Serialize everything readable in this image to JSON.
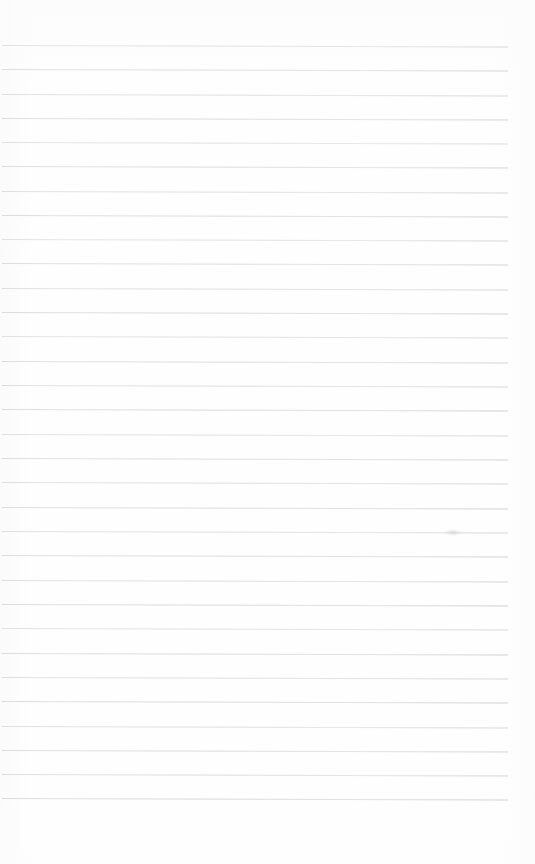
{
  "document": {
    "kind": "ruled-notebook-page",
    "title": "Blank Ruled Notebook Page",
    "page_width": 535,
    "page_height": 864,
    "background_color": "#fefefe",
    "content_text": "",
    "has_handwriting": false,
    "has_printed_text": false,
    "has_margin_rule": false
  },
  "ruling": {
    "line_color": "#dddee0",
    "line_thickness": 1,
    "line_count": 32,
    "first_line_y": 45,
    "last_line_y": 798,
    "line_spacing": 24.3,
    "line_start_x": 2,
    "line_end_x": 508,
    "skew_degrees": 0.18,
    "lines": [
      {
        "y": 45,
        "opacity": 0.72,
        "start_x": 2,
        "end_x": 508
      },
      {
        "y": 69,
        "opacity": 0.8,
        "start_x": 2,
        "end_x": 508
      },
      {
        "y": 94,
        "opacity": 0.76,
        "start_x": 2,
        "end_x": 508
      },
      {
        "y": 118,
        "opacity": 0.84,
        "start_x": 2,
        "end_x": 508
      },
      {
        "y": 142,
        "opacity": 0.7,
        "start_x": 2,
        "end_x": 508
      },
      {
        "y": 166,
        "opacity": 0.82,
        "start_x": 2,
        "end_x": 508
      },
      {
        "y": 191,
        "opacity": 0.78,
        "start_x": 2,
        "end_x": 508
      },
      {
        "y": 215,
        "opacity": 0.86,
        "start_x": 2,
        "end_x": 508
      },
      {
        "y": 239,
        "opacity": 0.74,
        "start_x": 2,
        "end_x": 508
      },
      {
        "y": 263,
        "opacity": 0.81,
        "start_x": 2,
        "end_x": 508
      },
      {
        "y": 288,
        "opacity": 0.77,
        "start_x": 2,
        "end_x": 508
      },
      {
        "y": 312,
        "opacity": 0.85,
        "start_x": 2,
        "end_x": 508
      },
      {
        "y": 336,
        "opacity": 0.73,
        "start_x": 2,
        "end_x": 508
      },
      {
        "y": 361,
        "opacity": 0.83,
        "start_x": 2,
        "end_x": 508
      },
      {
        "y": 385,
        "opacity": 0.79,
        "start_x": 2,
        "end_x": 508
      },
      {
        "y": 409,
        "opacity": 0.87,
        "start_x": 2,
        "end_x": 508
      },
      {
        "y": 434,
        "opacity": 0.75,
        "start_x": 2,
        "end_x": 508
      },
      {
        "y": 458,
        "opacity": 0.84,
        "start_x": 2,
        "end_x": 508
      },
      {
        "y": 482,
        "opacity": 0.78,
        "start_x": 2,
        "end_x": 508
      },
      {
        "y": 507,
        "opacity": 0.86,
        "start_x": 2,
        "end_x": 508
      },
      {
        "y": 531,
        "opacity": 0.76,
        "start_x": 2,
        "end_x": 508
      },
      {
        "y": 555,
        "opacity": 0.85,
        "start_x": 2,
        "end_x": 508
      },
      {
        "y": 580,
        "opacity": 0.8,
        "start_x": 2,
        "end_x": 508
      },
      {
        "y": 604,
        "opacity": 0.88,
        "start_x": 2,
        "end_x": 508
      },
      {
        "y": 628,
        "opacity": 0.74,
        "start_x": 2,
        "end_x": 508
      },
      {
        "y": 653,
        "opacity": 0.86,
        "start_x": 2,
        "end_x": 508
      },
      {
        "y": 677,
        "opacity": 0.79,
        "start_x": 2,
        "end_x": 508
      },
      {
        "y": 701,
        "opacity": 0.87,
        "start_x": 2,
        "end_x": 508
      },
      {
        "y": 726,
        "opacity": 0.77,
        "start_x": 2,
        "end_x": 508
      },
      {
        "y": 750,
        "opacity": 0.85,
        "start_x": 2,
        "end_x": 508
      },
      {
        "y": 774,
        "opacity": 0.81,
        "start_x": 2,
        "end_x": 508
      },
      {
        "y": 798,
        "opacity": 0.88,
        "start_x": 2,
        "end_x": 508
      }
    ]
  },
  "margins": {
    "top_blank_height": 45,
    "bottom_blank_height": 66,
    "right_blank_width": 27
  },
  "artifacts": [
    {
      "name": "scan-smudge",
      "x": 444,
      "y": 529,
      "width": 18,
      "height": 7
    }
  ]
}
